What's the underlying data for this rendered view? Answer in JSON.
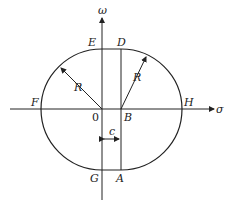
{
  "diagram": {
    "axes": {
      "vertical": "ω",
      "horizontal": "σ"
    },
    "points": {
      "E": "E",
      "D": "D",
      "F": "F",
      "H": "H",
      "O": "0",
      "B": "B",
      "G": "G",
      "A": "A"
    },
    "radius_labels": [
      "R",
      "R"
    ],
    "offset_label": "c"
  }
}
